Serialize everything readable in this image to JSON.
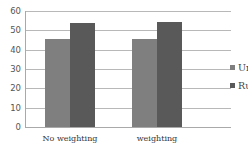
{
  "chart_data": {
    "type": "bar",
    "title": "",
    "xlabel": "",
    "ylabel": "",
    "categories": [
      "No weighting",
      "weighting"
    ],
    "series": [
      {
        "name": "Urban",
        "values": [
          45.5,
          45.5
        ],
        "color": "#7f7f7f"
      },
      {
        "name": "Rural",
        "values": [
          54,
          54.5
        ],
        "color": "#595959"
      }
    ],
    "ylim": [
      0,
      60
    ],
    "yticks": [
      0,
      10,
      20,
      30,
      40,
      50,
      60
    ],
    "grid": true,
    "legend_position": "right"
  },
  "yticks_labels": [
    "0",
    "10",
    "20",
    "30",
    "40",
    "50",
    "60"
  ],
  "legend": {
    "items": [
      {
        "label": "Urban",
        "color": "#7f7f7f"
      },
      {
        "label": "Rural",
        "color": "#595959"
      }
    ]
  }
}
